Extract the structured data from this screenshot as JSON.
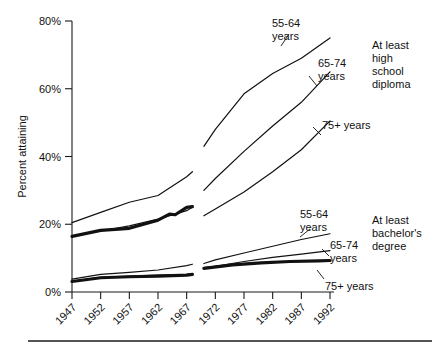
{
  "chart_data": {
    "type": "line",
    "title": "",
    "xlabel": "",
    "ylabel": "Percent attaining",
    "xlim": [
      1947,
      1992
    ],
    "ylim": [
      0,
      80
    ],
    "grid": false,
    "legend_position": "inline-right",
    "x_ticks": [
      "1947",
      "1952",
      "1957",
      "1962",
      "1967",
      "1972",
      "1977",
      "1982",
      "1987",
      "1992"
    ],
    "x_tick_values": [
      1947,
      1952,
      1957,
      1962,
      1967,
      1972,
      1977,
      1982,
      1987,
      1992
    ],
    "y_ticks": [
      "0%",
      "20%",
      "40%",
      "60%",
      "80%"
    ],
    "y_tick_values": [
      0,
      20,
      40,
      60,
      80
    ],
    "groups": [
      {
        "name": "At least high school diploma",
        "series": [
          {
            "name": "55-64 years",
            "weight": "thin",
            "segments": [
              {
                "x": [
                  1947,
                  1952,
                  1957,
                  1962,
                  1967,
                  1968
                ],
                "y": [
                  20.5,
                  23.5,
                  26.5,
                  28.5,
                  34.0,
                  35.5
                ]
              },
              {
                "x": [
                  1970,
                  1972,
                  1977,
                  1982,
                  1987,
                  1992
                ],
                "y": [
                  43.0,
                  48.0,
                  58.5,
                  64.5,
                  69.0,
                  75.0
                ]
              }
            ]
          },
          {
            "name": "65-74 years",
            "weight": "thin",
            "segments": [
              {
                "x": [
                  1947,
                  1952,
                  1957,
                  1962,
                  1967,
                  1968
                ],
                "y": [
                  16.5,
                  18.0,
                  19.5,
                  21.5,
                  24.0,
                  25.0
                ]
              },
              {
                "x": [
                  1970,
                  1972,
                  1977,
                  1982,
                  1987,
                  1992
                ],
                "y": [
                  30.0,
                  33.5,
                  41.5,
                  49.0,
                  56.0,
                  65.0
                ]
              }
            ]
          },
          {
            "name": "75+ years",
            "weight": "thin",
            "segments": [
              {
                "x": [
                  1970,
                  1972,
                  1977,
                  1982,
                  1987,
                  1992
                ],
                "y": [
                  22.5,
                  24.5,
                  29.5,
                  35.5,
                  42.0,
                  50.5
                ]
              }
            ]
          }
        ]
      },
      {
        "name": "At least bachelor's degree",
        "series": [
          {
            "name": "55-64 years",
            "weight": "thin",
            "segments": [
              {
                "x": [
                  1947,
                  1952,
                  1957,
                  1962,
                  1967,
                  1968
                ],
                "y": [
                  3.8,
                  5.2,
                  5.8,
                  6.5,
                  7.8,
                  8.2
                ]
              },
              {
                "x": [
                  1970,
                  1972,
                  1977,
                  1982,
                  1987,
                  1992
                ],
                "y": [
                  8.4,
                  9.5,
                  11.5,
                  13.5,
                  15.5,
                  17.2
                ]
              }
            ]
          },
          {
            "name": "65-74 years",
            "weight": "thin",
            "segments": [
              {
                "x": [
                  1947,
                  1952,
                  1957,
                  1962,
                  1967,
                  1968
                ],
                "y": [
                  3.2,
                  4.3,
                  4.7,
                  5.0,
                  5.2,
                  5.4
                ]
              },
              {
                "x": [
                  1970,
                  1972,
                  1977,
                  1982,
                  1987,
                  1992
                ],
                "y": [
                  7.0,
                  7.6,
                  9.0,
                  10.2,
                  11.2,
                  12.2
                ]
              }
            ]
          },
          {
            "name": "75+ years",
            "weight": "thin",
            "segments": [
              {
                "x": [
                  1970,
                  1972,
                  1977,
                  1982,
                  1987,
                  1992
                ],
                "y": [
                  7.2,
                  7.6,
                  8.4,
                  8.8,
                  9.0,
                  9.2
                ]
              }
            ]
          }
        ]
      }
    ],
    "emphasis_series": [
      {
        "name": "65-74 years high school emphasis",
        "weight": "thick",
        "segments": [
          {
            "x": [
              1947,
              1952,
              1957,
              1962,
              1964,
              1965,
              1967,
              1968
            ],
            "y": [
              16.4,
              18.2,
              18.8,
              21.2,
              23.0,
              22.8,
              25.0,
              25.2
            ]
          }
        ]
      },
      {
        "name": "65-74 years bachelor emphasis",
        "weight": "thick",
        "segments": [
          {
            "x": [
              1947,
              1952,
              1957,
              1962,
              1967,
              1968
            ],
            "y": [
              3.1,
              4.2,
              4.5,
              4.7,
              5.0,
              5.2
            ]
          }
        ]
      },
      {
        "name": "55-64 years bachelor emphasis right",
        "weight": "thick",
        "segments": [
          {
            "x": [
              1970,
              1975,
              1980,
              1985,
              1990,
              1992
            ],
            "y": [
              7.0,
              8.0,
              8.6,
              9.0,
              9.2,
              9.3
            ]
          }
        ]
      }
    ],
    "annotations": [
      {
        "label": "55-64\nyears",
        "group": "high-school",
        "x_px": 272,
        "y_px": 18
      },
      {
        "label": "65-74\nyears",
        "group": "high-school",
        "x_px": 318,
        "y_px": 58
      },
      {
        "label": "75+ years",
        "group": "high-school",
        "x_px": 322,
        "y_px": 120
      },
      {
        "label": "At least\nhigh\nschool\ndiploma",
        "group": "high-school-title",
        "x_px": 372,
        "y_px": 40
      },
      {
        "label": "55-64\nyears",
        "group": "bachelor",
        "x_px": 300,
        "y_px": 209
      },
      {
        "label": "65-74\nyears",
        "group": "bachelor",
        "x_px": 330,
        "y_px": 240
      },
      {
        "label": "75+ years",
        "group": "bachelor",
        "x_px": 325,
        "y_px": 281
      },
      {
        "label": "At least\nbachelor's\ndegree",
        "group": "bachelor-title",
        "x_px": 372,
        "y_px": 215
      }
    ]
  },
  "labels": {
    "y_axis_title": "Percent attaining",
    "hs_group_title_lines": [
      "At least",
      "high",
      "school",
      "diploma"
    ],
    "ba_group_title_lines": [
      "At least",
      "bachelor's",
      "degree"
    ],
    "age_55_64_line1": "55-64",
    "age_55_64_line2": "years",
    "age_65_74_line1": "65-74",
    "age_65_74_line2": "years",
    "age_75_plus": "75+ years"
  }
}
